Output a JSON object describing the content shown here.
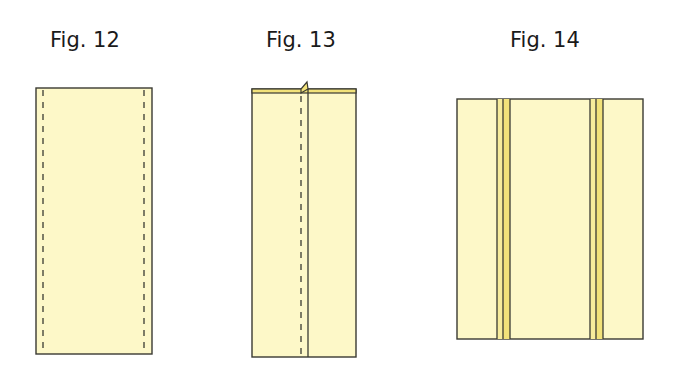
{
  "figures": [
    {
      "id": "fig12",
      "label": "Fig. 12",
      "description": "Fabric strip with two dashed stitch lines near each long edge"
    },
    {
      "id": "fig13",
      "label": "Fig. 13",
      "description": "Strip folded with seam allowance pressed, showing dashed stitch line and fold"
    },
    {
      "id": "fig14",
      "label": "Fig. 14",
      "description": "Wider panel with two narrow inset strips"
    }
  ],
  "colors": {
    "fabric": "#fdf8c8",
    "fabric_dark": "#f2e27a",
    "outline": "#3a3a32",
    "dash": "#3a3a32"
  }
}
